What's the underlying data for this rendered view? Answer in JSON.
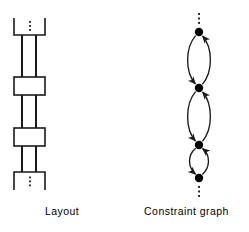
{
  "figure": {
    "background_color": "#ffffff",
    "stroke_color": "#1a1a1a",
    "node_fill_color": "#000000",
    "panels": [
      {
        "id": "layout",
        "caption": "Layout",
        "description": "Vertical chain of cells connected by two parallel rails, truncated top and bottom with vertical ellipsis"
      },
      {
        "id": "constraint-graph",
        "caption": "Constraint graph",
        "description": "Vertical chain of filled nodes joined by pairs of curved bidirectional arrows, truncated top and bottom with vertical ellipsis"
      }
    ]
  },
  "layout_diagram": {
    "rail_x": [
      22,
      36
    ],
    "rail_top": 35,
    "rail_bottom": 172,
    "open_cells": [
      {
        "name": "top-open-cell",
        "x": 14,
        "y": 18,
        "width": 31,
        "height": 17,
        "open_side": "top"
      },
      {
        "name": "bottom-open-cell",
        "x": 14,
        "y": 172,
        "width": 31,
        "height": 18,
        "open_side": "bottom"
      }
    ],
    "closed_cells": [
      {
        "name": "cell-1",
        "x": 14,
        "y": 77,
        "width": 31,
        "height": 18
      },
      {
        "name": "cell-2",
        "x": 14,
        "y": 128,
        "width": 31,
        "height": 18
      }
    ],
    "ellipses": [
      {
        "name": "top-ellipsis",
        "cx": 30,
        "cy": 26,
        "dots": 3
      },
      {
        "name": "bottom-ellipsis",
        "cx": 30,
        "cy": 181,
        "dots": 3
      }
    ]
  },
  "constraint_graph": {
    "center_x": 75,
    "node_radius": 4.2,
    "nodes": [
      {
        "name": "node-1",
        "cx": 75,
        "cy": 32
      },
      {
        "name": "node-2",
        "cx": 75,
        "cy": 88
      },
      {
        "name": "node-3",
        "cx": 75,
        "cy": 145
      },
      {
        "name": "node-4",
        "cx": 75,
        "cy": 178
      }
    ],
    "edge_pairs": [
      {
        "name": "edge-pair-1-2",
        "from_cy": 32,
        "to_cy": 88,
        "bulge": 13
      },
      {
        "name": "edge-pair-2-3",
        "from_cy": 88,
        "to_cy": 145,
        "bulge": 13
      },
      {
        "name": "edge-pair-3-4",
        "from_cy": 145,
        "to_cy": 178,
        "bulge": 10
      }
    ],
    "ellipses": [
      {
        "name": "top-ellipsis",
        "cx": 75,
        "cy": 18,
        "dots": 3
      },
      {
        "name": "bottom-ellipsis",
        "cx": 75,
        "cy": 190,
        "dots": 3
      }
    ]
  }
}
